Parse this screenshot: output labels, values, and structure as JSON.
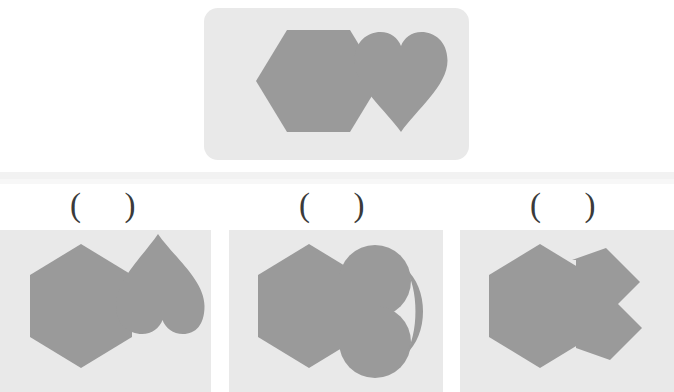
{
  "puzzle": {
    "type": "shape-composition-multiple-choice",
    "background_color": "#ffffff",
    "panel_color": "#e9e9e9",
    "shape_color": "#9a9a9a",
    "prompt": {
      "panel_name": "prompt-panel",
      "shapes": [
        {
          "name": "hexagon",
          "orientation": "flat-top-pointy-side",
          "label": "hexagon"
        },
        {
          "name": "heart",
          "orientation": "upright",
          "label": "heart"
        }
      ]
    },
    "options": [
      {
        "id": "A",
        "marker": "(  )",
        "composition": "hexagon joined with heart rotated 90 degrees, lobes to the right",
        "hexagon_orientation": "pointy-top",
        "attached_shape": "heart-rotated-right"
      },
      {
        "id": "B",
        "marker": "(  )",
        "composition": "hexagon joined with rounded clover-like heart, lobes to the right",
        "hexagon_orientation": "pointy-top",
        "attached_shape": "heart-round-lobes-right"
      },
      {
        "id": "C",
        "marker": "(  )",
        "composition": "hexagon joined with angular faceted polygon pointing right",
        "hexagon_orientation": "pointy-top",
        "attached_shape": "angular-polygon-right"
      }
    ]
  }
}
